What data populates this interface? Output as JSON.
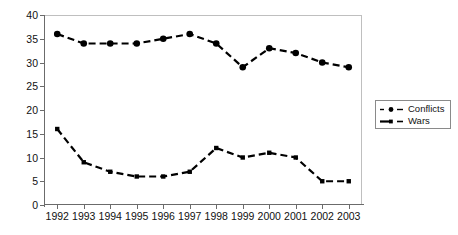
{
  "chart_data": {
    "type": "line",
    "title": "",
    "xlabel": "",
    "ylabel": "",
    "categories": [
      "1992",
      "1993",
      "1994",
      "1995",
      "1996",
      "1997",
      "1998",
      "1999",
      "2000",
      "2001",
      "2002",
      "2003"
    ],
    "series": [
      {
        "name": "Conflicts",
        "marker": "circle",
        "line_style": "dashed",
        "color": "#000000",
        "values": [
          36,
          34,
          34,
          34,
          35,
          36,
          34,
          29,
          33,
          32,
          30,
          29
        ]
      },
      {
        "name": "Wars",
        "marker": "square",
        "line_style": "dashed",
        "color": "#000000",
        "values": [
          16,
          9,
          7,
          6,
          6,
          7,
          12,
          10,
          11,
          10,
          5,
          5
        ]
      }
    ],
    "ylim": [
      0,
      40
    ],
    "ytick_values": [
      0,
      5,
      10,
      15,
      20,
      25,
      30,
      35,
      40
    ],
    "ytick_labels": [
      "0",
      "5",
      "10",
      "15",
      "20",
      "25",
      "30",
      "35",
      "40"
    ],
    "grid": false,
    "legend_position": "right",
    "legend_entries": [
      "Conflicts",
      "Wars"
    ]
  }
}
